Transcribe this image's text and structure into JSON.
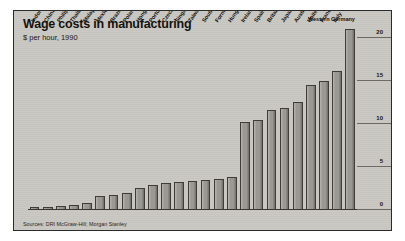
{
  "title": "Wage costs in manufacturing",
  "subtitle": "$ per hour, 1990",
  "source": "Sources: DRI McGraw-Hill; Morgan Stanley",
  "chart_data": {
    "type": "bar",
    "title": "Wage costs in manufacturing",
    "subtitle": "$ per hour, 1990",
    "xlabel": "",
    "ylabel": "$ per hour",
    "ylim": [
      0,
      21.5
    ],
    "yticks": [
      0,
      5,
      10,
      15,
      20
    ],
    "ytick_labels": [
      "0",
      "5",
      "10",
      "15",
      "20"
    ],
    "grid": true,
    "axis_position": "right",
    "legend": "none",
    "bar_color": "#9a9892",
    "categories": [
      "Indonesia",
      "China",
      "Philippines",
      "Thailand",
      "Malaysia",
      "Mexico",
      "Brazil",
      "Poland",
      "Hong Kong",
      "Portugal",
      "Czechoslovakia",
      "Singapore",
      "Taiwan",
      "South Korea",
      "Former Soviet Union",
      "Hungary",
      "Ireland",
      "Spain",
      "Britain",
      "Japan",
      "Australia",
      "United States",
      "France",
      "Italy",
      "Western Germany"
    ],
    "values": [
      0.3,
      0.4,
      0.5,
      0.6,
      0.8,
      1.6,
      1.8,
      2.0,
      2.6,
      2.9,
      3.1,
      3.3,
      3.4,
      3.5,
      3.6,
      3.8,
      10.2,
      10.5,
      11.6,
      11.9,
      12.6,
      14.5,
      15.0,
      16.2,
      21.0
    ],
    "highlighted": "Western Germany"
  }
}
